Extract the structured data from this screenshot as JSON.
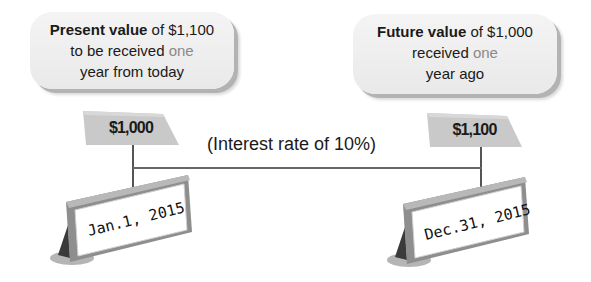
{
  "diagram": {
    "left_bubble": {
      "bold": "Present value",
      "rest_line1": " of $1,100",
      "line2_a": "to be received ",
      "line2_muted": "one",
      "line3": "year from today"
    },
    "right_bubble": {
      "bold": "Future value",
      "rest_line1": " of $1,000",
      "line2_a": "received ",
      "line2_muted": "one",
      "line3": "year ago"
    },
    "left_flag": {
      "amount": "$1,000"
    },
    "right_flag": {
      "amount": "$1,100"
    },
    "interest_label": "(Interest rate of 10%)",
    "left_sign": {
      "date": "Jan.1, 2015"
    },
    "right_sign": {
      "date": "Dec.31, 2015"
    },
    "colors": {
      "bubble_fill": "#eeeeee",
      "flag_fill": "#c9c9c9",
      "sign_face": "#ffffff",
      "sign_frame": "#9a9a9a"
    }
  }
}
